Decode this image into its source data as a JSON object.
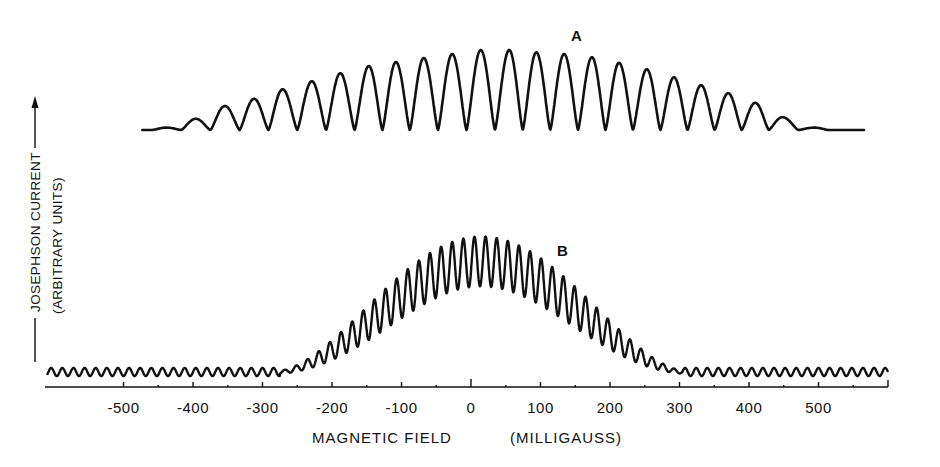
{
  "chart_data": {
    "type": "line",
    "title": "",
    "xlabel": "MAGNETIC FIELD",
    "xlabel_units": "(MILLIGAUSS)",
    "ylabel": "JOSEPHSON CURRENT",
    "ylabel_units": "(ARBITRARY UNITS)",
    "xlim": [
      -620,
      600
    ],
    "ylim": [
      0,
      1
    ],
    "grid": false,
    "legend": "none (curves labeled inline A and B)",
    "x_ticks": [
      -500,
      -400,
      -300,
      -200,
      -100,
      0,
      100,
      200,
      300,
      400,
      500
    ],
    "x_tick_labels": [
      "-500",
      "-400",
      "-300",
      "-200",
      "-100",
      "0",
      "100",
      "200",
      "300",
      "400",
      "500"
    ],
    "series": [
      {
        "name": "A",
        "description": "Interference pattern with ~40 mG period, broad envelope, ~23 visible maxima",
        "period_mG": 40,
        "x_range": [
          -473,
          566
        ],
        "peak_x": [
          -438,
          -396,
          -354,
          -312,
          -271,
          -229,
          -188,
          -147,
          -108,
          -68,
          -27,
          14,
          55,
          94,
          134,
          174,
          213,
          253,
          292,
          331,
          370,
          409,
          448,
          494
        ],
        "peak_y": [
          0.03,
          0.14,
          0.3,
          0.39,
          0.51,
          0.61,
          0.71,
          0.8,
          0.85,
          0.9,
          0.95,
          1.0,
          1.0,
          0.97,
          0.95,
          0.91,
          0.84,
          0.76,
          0.66,
          0.56,
          0.46,
          0.34,
          0.16,
          0.03
        ]
      },
      {
        "name": "B",
        "description": "Faster interference pattern (~16 mG period) under a bell-shaped envelope",
        "period_mG": 16,
        "x_range": [
          -620,
          600
        ],
        "envelope_center_mG": 15,
        "envelope_halfwidth_mG": 290,
        "peak_max": 1.0,
        "trough_fraction_at_center": 0.62,
        "baseline_ripple": 0.03
      }
    ],
    "annotations": [
      {
        "text": "A",
        "x_mG": 145,
        "near": "top of curve A"
      },
      {
        "text": "B",
        "x_mG": 127,
        "near": "top of curve B"
      }
    ]
  },
  "labels": {
    "curve_a": "A",
    "curve_b": "B",
    "x_axis_title": "MAGNETIC FIELD",
    "x_axis_units": "(MILLIGAUSS)",
    "y_axis_title": "JOSEPHSON CURRENT",
    "y_axis_units": "(ARBITRARY UNITS)"
  }
}
